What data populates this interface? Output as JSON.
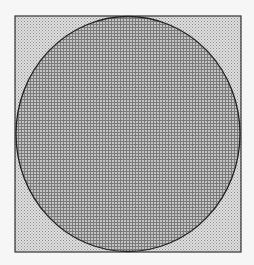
{
  "figure": {
    "square": {
      "x": 15,
      "y": 16,
      "width": 226,
      "height": 236,
      "stroke": "#333333",
      "fill_pattern": "dots",
      "fill_color": "#cfcfcf"
    },
    "circle": {
      "cx": 128,
      "cy": 134,
      "rx": 112,
      "ry": 117,
      "stroke": "#222222",
      "fill_pattern": "grid",
      "fill_color": "#a8a8a8"
    },
    "background": "#f6f6f6"
  }
}
